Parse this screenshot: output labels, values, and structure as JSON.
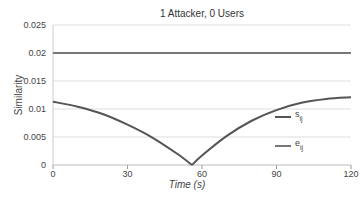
{
  "chart_data": {
    "type": "line",
    "title": "1 Attacker, 0 Users",
    "xlabel": "Time (s)",
    "ylabel": "Similarity",
    "xlim": [
      0,
      120
    ],
    "ylim": [
      0,
      0.025
    ],
    "xticks": [
      0,
      30,
      60,
      90,
      120
    ],
    "yticks": [
      0,
      0.005,
      0.01,
      0.015,
      0.02,
      0.025
    ],
    "ytick_labels": [
      "0",
      "0.005",
      "0.01",
      "0.015",
      "0.02",
      "0.025"
    ],
    "grid": true,
    "legend_position": "right-inside",
    "series": [
      {
        "name": "s_ij",
        "label_main": "s",
        "label_sub": "ij",
        "color": "#555555",
        "x": [
          0,
          10,
          20,
          30,
          40,
          50,
          56,
          60,
          70,
          80,
          90,
          100,
          110,
          120
        ],
        "values": [
          0.0113,
          0.0104,
          0.0091,
          0.0072,
          0.0049,
          0.002,
          0.0,
          0.0017,
          0.0052,
          0.0079,
          0.0098,
          0.0111,
          0.0118,
          0.0121
        ]
      },
      {
        "name": "e_ij",
        "label_main": "e",
        "label_sub": "ij",
        "color": "#777777",
        "x": [
          0,
          120
        ],
        "values": [
          0.02,
          0.02
        ]
      }
    ]
  }
}
